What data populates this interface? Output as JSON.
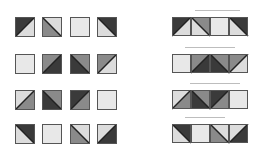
{
  "colors": {
    "dark": "#3a3a3a",
    "mid": "#8a8a8a",
    "light": "#dcdcdc",
    "plain": "#e8e8e8",
    "line": "#222222"
  },
  "grid": {
    "col_x": [
      15,
      42,
      70,
      97
    ],
    "row_y": [
      17,
      54,
      90,
      124
    ],
    "rows": [
      [
        {
          "diag": "bl-tr",
          "a": "dark",
          "b": "light"
        },
        {
          "diag": "tl-br",
          "a": "mid",
          "b": "light"
        },
        {
          "diag": "none",
          "a": "plain",
          "b": "plain"
        },
        {
          "diag": "tl-br",
          "a": "light",
          "b": "dark"
        }
      ],
      [
        {
          "diag": "none",
          "a": "plain",
          "b": "plain"
        },
        {
          "diag": "bl-tr",
          "a": "mid",
          "b": "dark"
        },
        {
          "diag": "tl-br",
          "a": "dark",
          "b": "mid"
        },
        {
          "diag": "bl-tr",
          "a": "mid",
          "b": "light"
        }
      ],
      [
        {
          "diag": "bl-tr",
          "a": "light",
          "b": "mid"
        },
        {
          "diag": "tl-br",
          "a": "dark",
          "b": "mid"
        },
        {
          "diag": "bl-tr",
          "a": "dark",
          "b": "mid"
        },
        {
          "diag": "none",
          "a": "plain",
          "b": "plain"
        }
      ],
      [
        {
          "diag": "tl-br",
          "a": "light",
          "b": "dark"
        },
        {
          "diag": "none",
          "a": "plain",
          "b": "plain"
        },
        {
          "diag": "tl-br",
          "a": "mid",
          "b": "light"
        },
        {
          "diag": "bl-tr",
          "a": "light",
          "b": "dark"
        }
      ]
    ]
  },
  "strips": {
    "x": 172,
    "row_y": [
      17,
      54,
      90,
      124
    ],
    "arrows": [
      {
        "x": 195,
        "y": 10,
        "w": 45
      },
      {
        "x": 185,
        "y": 47,
        "w": 50
      },
      {
        "x": 190,
        "y": 83,
        "w": 50
      },
      {
        "x": 185,
        "y": 117,
        "w": 40
      }
    ]
  }
}
